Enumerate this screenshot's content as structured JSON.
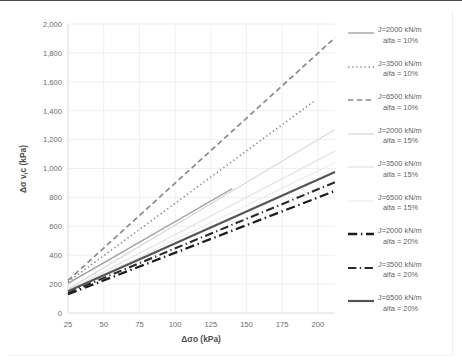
{
  "chart_data": {
    "type": "line",
    "title": "",
    "xlabel": "Δσo (kPa)",
    "ylabel": "Δσ v,c (kPa)",
    "xlim": [
      25,
      212
    ],
    "ylim": [
      0,
      2000
    ],
    "xticks": [
      25,
      50,
      75,
      100,
      125,
      150,
      175,
      200
    ],
    "xtick_labels": [
      "25",
      "50",
      "75",
      "100",
      "125",
      "150",
      "175",
      "200"
    ],
    "yticks": [
      0,
      200,
      400,
      600,
      800,
      1000,
      1200,
      1400,
      1600,
      1800,
      2000
    ],
    "ytick_labels": [
      "0",
      "200",
      "400",
      "600",
      "800",
      "1,000",
      "1,200",
      "1,400",
      "1,600",
      "1,800",
      "2,000"
    ],
    "grid": true,
    "legend_position": "right",
    "series": [
      {
        "name": "J=2000 kN/m alfa = 10%",
        "label_line1": "J=2000 kN/m",
        "label_line2": "alfa = 10%",
        "style": "solid",
        "color": "#9b9b9b",
        "width": 1.3,
        "x": [
          25,
          140
        ],
        "y": [
          205,
          860
        ]
      },
      {
        "name": "J=3500 kN/m alfa = 10%",
        "label_line1": "J=3500 kN/m",
        "label_line2": "alfa = 10%",
        "style": "dotted",
        "color": "#8d8d8d",
        "width": 1.6,
        "x": [
          25,
          198
        ],
        "y": [
          215,
          1470
        ]
      },
      {
        "name": "J=6500 kN/m alfa = 10%",
        "label_line1": "J=6500 kN/m",
        "label_line2": "alfa = 10%",
        "style": "dashed",
        "color": "#8a8a8a",
        "width": 1.7,
        "x": [
          25,
          212
        ],
        "y": [
          225,
          1905
        ]
      },
      {
        "name": "J=2000 kN/m alfa = 15%",
        "label_line1": "J=2000 kN/m",
        "label_line2": "alfa = 15%",
        "style": "solid",
        "color": "#dcdcdc",
        "width": 1.4,
        "x": [
          25,
          212
        ],
        "y": [
          165,
          1270
        ]
      },
      {
        "name": "J=3500 kN/m alfa = 15%",
        "label_line1": "J=3500 kN/m",
        "label_line2": "alfa = 15%",
        "style": "solid",
        "color": "#e6e6e6",
        "width": 1.4,
        "x": [
          25,
          212
        ],
        "y": [
          155,
          1120
        ]
      },
      {
        "name": "J=6500 kN/m alfa = 15%",
        "label_line1": "J=6500 kN/m",
        "label_line2": "alfa = 15%",
        "style": "solid",
        "color": "#efefef",
        "width": 1.4,
        "x": [
          25,
          212
        ],
        "y": [
          150,
          1040
        ]
      },
      {
        "name": "J=2000 kN/m alfa = 20%",
        "label_line1": "J=2000 kN/m",
        "label_line2": "alfa = 20%",
        "style": "dashdot",
        "color": "#1c1c1c",
        "width": 2.3,
        "x": [
          25,
          212
        ],
        "y": [
          130,
          845
        ]
      },
      {
        "name": "J=3500 kN/m alfa = 20%",
        "label_line1": "J=3500 kN/m",
        "label_line2": "alfa = 20%",
        "style": "dashdot",
        "color": "#2a2a2a",
        "width": 2.1,
        "x": [
          25,
          212
        ],
        "y": [
          140,
          905
        ]
      },
      {
        "name": "J=6500 kN/m alfa = 20%",
        "label_line1": "J=6500 kN/m",
        "label_line2": "alfa = 20%",
        "style": "solid",
        "color": "#555555",
        "width": 2.2,
        "x": [
          25,
          212
        ],
        "y": [
          150,
          975
        ]
      }
    ]
  }
}
